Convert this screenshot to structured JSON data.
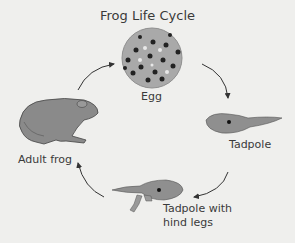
{
  "title": "Frog Life Cycle",
  "stages": [
    {
      "label": "Egg"
    },
    {
      "label": "Tadpole"
    },
    {
      "label": "Tadpole with hind legs",
      "line1": "Tadpole with",
      "line2": "hind legs"
    },
    {
      "label": "Adult frog"
    }
  ],
  "colors": {
    "background": "#efefed",
    "body": "#8a8a8a",
    "egg": "#a9a9a9",
    "arrow": "#333333"
  }
}
